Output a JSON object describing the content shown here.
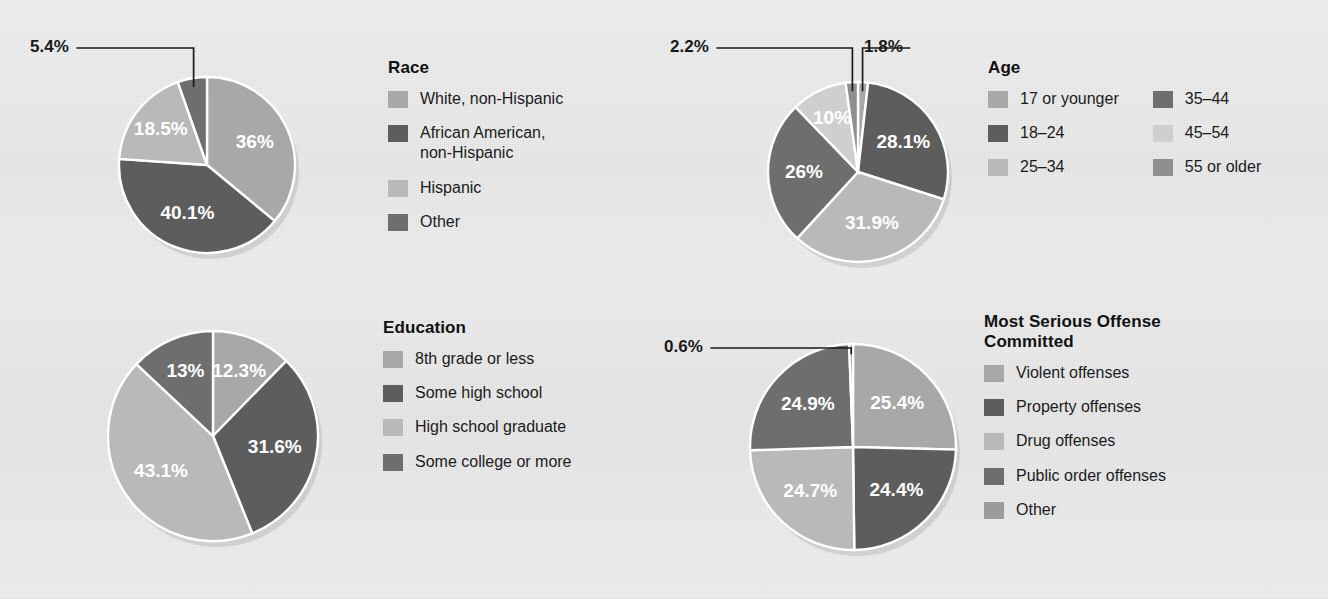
{
  "background": {
    "paper": "#ececed",
    "slice_stroke": "#ffffff",
    "label_color": "#ffffff",
    "text_color": "#1a1a1a"
  },
  "palette": {
    "g1": "#a8a8a8",
    "g2": "#5d5d5d",
    "g3": "#b9b9b9",
    "g4": "#6e6e6e",
    "g5": "#cfcfcf",
    "g6": "#8f8f8f",
    "g7": "#9b9b9b"
  },
  "chart_data": [
    {
      "type": "pie",
      "id": "race",
      "title": "Race",
      "categories": [
        "White, non-Hispanic",
        "African American,\nnon-Hispanic",
        "Hispanic",
        "Other"
      ],
      "values": [
        36,
        40.1,
        18.5,
        5.4
      ],
      "labels": [
        "36%",
        "40.1%",
        "18.5%",
        "5.4%"
      ],
      "colors": [
        "#a8a8a8",
        "#5d5d5d",
        "#b9b9b9",
        "#6e6e6e"
      ],
      "callouts": [
        "5.4%"
      ],
      "legend_position": "right",
      "legend_columns": 1
    },
    {
      "type": "pie",
      "id": "age",
      "title": "Age",
      "categories": [
        "17 or younger",
        "18–24",
        "25–34",
        "35–44",
        "45–54",
        "55 or older"
      ],
      "values": [
        1.8,
        28.1,
        31.9,
        26,
        10,
        2.2
      ],
      "labels": [
        "1.8%",
        "28.1%",
        "31.9%",
        "26%",
        "10%",
        "2.2%"
      ],
      "colors": [
        "#a8a8a8",
        "#5d5d5d",
        "#b9b9b9",
        "#6e6e6e",
        "#cfcfcf",
        "#8f8f8f"
      ],
      "callouts": [
        "2.2%",
        "1.8%"
      ],
      "legend_position": "right",
      "legend_columns": 2
    },
    {
      "type": "pie",
      "id": "education",
      "title": "Education",
      "categories": [
        "8th grade or less",
        "Some high school",
        "High school graduate",
        "Some college or more"
      ],
      "values": [
        12.3,
        31.6,
        43.1,
        13
      ],
      "labels": [
        "12.3%",
        "31.6%",
        "43.1%",
        "13%"
      ],
      "colors": [
        "#a8a8a8",
        "#5d5d5d",
        "#b9b9b9",
        "#6e6e6e"
      ],
      "callouts": [],
      "legend_position": "right",
      "legend_columns": 1
    },
    {
      "type": "pie",
      "id": "offense",
      "title": "Most Serious Offense\nCommitted",
      "categories": [
        "Violent offenses",
        "Property offenses",
        "Drug offenses",
        "Public order offenses",
        "Other"
      ],
      "values": [
        25.4,
        24.4,
        24.7,
        24.9,
        0.6
      ],
      "labels": [
        "25.4%",
        "24.4%",
        "24.7%",
        "24.9%",
        "0.6%"
      ],
      "colors": [
        "#a8a8a8",
        "#5d5d5d",
        "#b9b9b9",
        "#6e6e6e",
        "#9b9b9b"
      ],
      "callouts": [
        "0.6%"
      ],
      "legend_position": "right",
      "legend_columns": 1
    }
  ],
  "layout": {
    "race": {
      "cx": 207,
      "cy": 165,
      "r": 88
    },
    "age": {
      "cx": 858,
      "cy": 172,
      "r": 90
    },
    "education": {
      "cx": 213,
      "cy": 436,
      "r": 105
    },
    "offense": {
      "cx": 853,
      "cy": 447,
      "r": 103
    }
  }
}
